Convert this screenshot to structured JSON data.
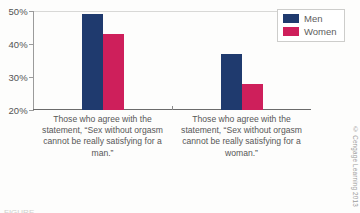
{
  "chart_data": {
    "type": "bar",
    "title": "",
    "xlabel": "",
    "ylabel": "",
    "ylim": [
      20,
      50
    ],
    "ytick_labels": [
      "50%",
      "40%",
      "30%",
      "20%"
    ],
    "ytick_values": [
      50,
      40,
      30,
      20
    ],
    "grid": false,
    "legend_position": "top-right",
    "categories": [
      "Those who agree with the statement, “Sex without orgasm cannot be really satisfying for a man.”",
      "Those who agree with the statement, “Sex without orgasm cannot be really satisfying for a woman.”"
    ],
    "series": [
      {
        "name": "Men",
        "color": "#1f3a6e",
        "values": [
          49,
          37
        ]
      },
      {
        "name": "Women",
        "color": "#ce1f5b",
        "values": [
          43,
          28
        ]
      }
    ]
  },
  "legend": {
    "items": [
      {
        "label": "Men"
      },
      {
        "label": "Women"
      }
    ]
  },
  "credit": "© Cengage Learning 2013",
  "caption": "FIGURE"
}
